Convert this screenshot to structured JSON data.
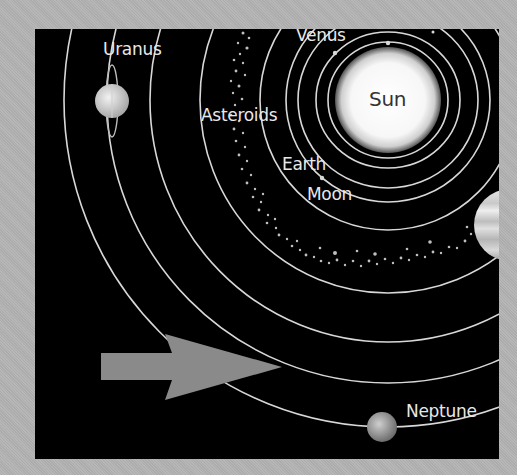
{
  "diagram": {
    "type": "solar-system",
    "background_color": "#b3b3b3",
    "panel_color": "#000000",
    "orbit_color": "#d8d8d8",
    "sun": {
      "label": "Sun",
      "cx": 353,
      "cy": 71,
      "r": 53
    },
    "labels": {
      "uranus": "Uranus",
      "venus": "Venus",
      "asteroids": "Asteroids",
      "earth": "Earth",
      "moon": "Moon",
      "neptune": "Neptune",
      "sun": "Sun"
    },
    "orbits_radii": [
      60,
      72,
      90,
      102,
      128,
      188,
      238,
      281,
      324
    ],
    "arrow": {
      "color": "#8a8a8a",
      "direction": "right"
    }
  }
}
